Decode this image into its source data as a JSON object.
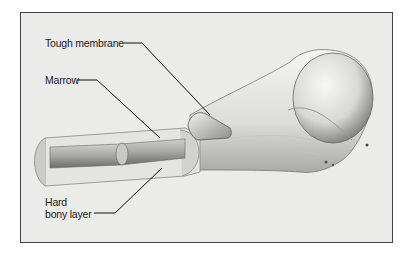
{
  "figure": {
    "labels": {
      "tough_membrane": "Tough membrane",
      "marrow": "Marrow",
      "hard_bony_layer_line1": "Hard",
      "hard_bony_layer_line2": "bony layer"
    }
  }
}
